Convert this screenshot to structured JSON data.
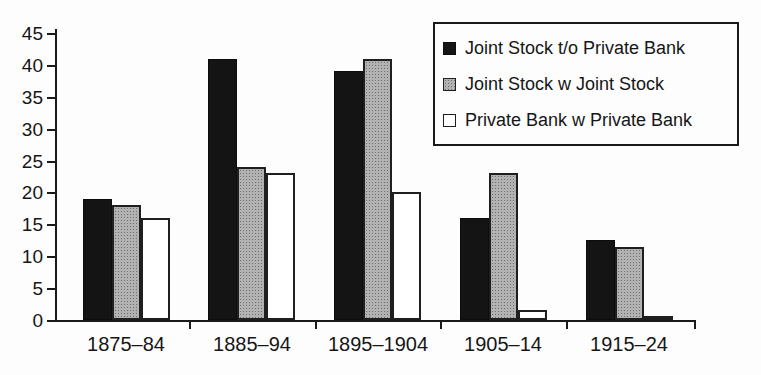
{
  "chart_data": {
    "type": "bar",
    "title": "",
    "xlabel": "",
    "ylabel": "",
    "categories": [
      "1875–84",
      "1885–94",
      "1895–1904",
      "1905–14",
      "1915–24"
    ],
    "series": [
      {
        "name": "Joint Stock t/o Private Bank",
        "color": "#141414",
        "style": "solid-black",
        "values": [
          19,
          41,
          39,
          16,
          12.5
        ]
      },
      {
        "name": "Joint Stock w Joint Stock",
        "color": "#a9a9a9",
        "style": "halftone-gray",
        "values": [
          18,
          24,
          41,
          23,
          11.5
        ]
      },
      {
        "name": "Private Bank w Private Bank",
        "color": "#ffffff",
        "style": "white-outline",
        "values": [
          16,
          23,
          20,
          1.5,
          0.7
        ]
      }
    ],
    "ylim": [
      0,
      45
    ],
    "ytick_step": 5,
    "yticks": [
      0,
      5,
      10,
      15,
      20,
      25,
      30,
      35,
      40,
      45
    ],
    "grid": false,
    "legend_position": "top-right",
    "axis_color": "#1a1a1a",
    "background_color": "#fdfdfd"
  }
}
